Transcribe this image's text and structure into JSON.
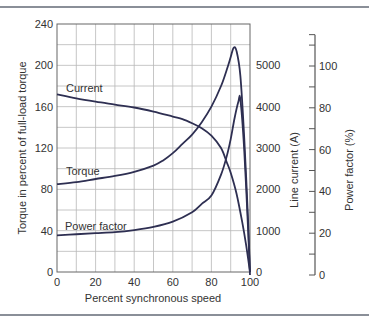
{
  "chart_data": {
    "type": "line",
    "title": "",
    "xlabel": "Percent synchronous speed",
    "ylabel": "Torque in percent of full-load torque",
    "y2label": "Line current (A)",
    "y3label": "Power factor (%)",
    "xlim": [
      0,
      100
    ],
    "ylim": [
      0,
      240
    ],
    "y2lim": [
      0,
      6000
    ],
    "y3lim": [
      0,
      115
    ],
    "x_ticks": [
      "0",
      "20",
      "40",
      "60",
      "80",
      "100"
    ],
    "y_ticks": [
      "0",
      "40",
      "80",
      "120",
      "160",
      "200",
      "240"
    ],
    "y2_ticks": [
      "0",
      "1000",
      "2000",
      "3000",
      "4000",
      "5000"
    ],
    "y3_ticks": [
      "0",
      "20",
      "40",
      "60",
      "80",
      "100"
    ],
    "grid": true,
    "legend": "inline curve labels",
    "series": [
      {
        "name": "Current",
        "axis": "y2",
        "unit": "A",
        "x": [
          0,
          10,
          20,
          30,
          40,
          50,
          60,
          65,
          70,
          75,
          80,
          85,
          88,
          90,
          93,
          96,
          98,
          100
        ],
        "values": [
          4300,
          4200,
          4120,
          4050,
          3980,
          3880,
          3760,
          3700,
          3600,
          3480,
          3300,
          3000,
          2650,
          2400,
          1900,
          1200,
          650,
          0
        ]
      },
      {
        "name": "Torque",
        "axis": "y",
        "unit": "% full-load torque",
        "x": [
          0,
          10,
          20,
          30,
          40,
          50,
          55,
          60,
          65,
          70,
          75,
          80,
          85,
          88,
          90,
          91.5,
          93,
          95,
          97,
          99,
          100
        ],
        "values": [
          85,
          87,
          90,
          93,
          97,
          103,
          108,
          115,
          124,
          133,
          145,
          160,
          180,
          196,
          208,
          217,
          214,
          190,
          130,
          50,
          0
        ]
      },
      {
        "name": "Power factor",
        "axis": "y3",
        "unit": "%",
        "x": [
          0,
          10,
          20,
          30,
          40,
          50,
          60,
          70,
          75,
          80,
          85,
          88,
          90,
          92,
          94,
          95,
          97,
          99,
          100
        ],
        "values": [
          19,
          19.5,
          20,
          20.5,
          21.5,
          23,
          25.5,
          30,
          34,
          38,
          48,
          57,
          65,
          75,
          83,
          84,
          60,
          22,
          0
        ]
      }
    ]
  },
  "labels": {
    "current": "Current",
    "torque": "Torque",
    "power_factor": "Power factor",
    "x_title": "Percent synchronous speed",
    "y_title": "Torque in percent of full-load torque",
    "y2_title": "Line current (A)",
    "y3_title": "Power factor (%)"
  },
  "colors": {
    "curve": "#2e2f52",
    "grid": "#b8b8b8",
    "axis": "#555555",
    "rule": "#8a8f98"
  }
}
